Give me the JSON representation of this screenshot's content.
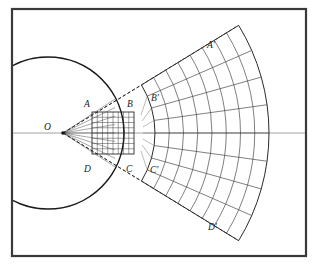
{
  "figure": {
    "background_color": "#ffffff",
    "ink_color": "#1a1a1a",
    "frame": {
      "name": "outer-border",
      "x": 12,
      "y": 9,
      "width": 294,
      "height": 247,
      "stroke": "#3a3a3a",
      "stroke_width": 2.2
    },
    "axis": {
      "name": "horizontal-optical-axis",
      "y": 133,
      "x1": 12,
      "x2": 306,
      "stroke": "#8a8a8a",
      "stroke_width": 0.8
    },
    "origin": {
      "label": "O",
      "x": 63,
      "y": 133,
      "label_x": 44,
      "label_y": 130
    },
    "circle": {
      "name": "reference-circle",
      "cx": 48,
      "cy": 133,
      "r": 76,
      "stroke": "#1a1a1a",
      "stroke_width": 1.6
    },
    "source_square": {
      "name": "source-grid-ABCD",
      "x": 92,
      "y": 112,
      "width": 42,
      "height": 42,
      "rows": 8,
      "columns": 8,
      "stroke": "#2a2a2a",
      "corner_labels": [
        {
          "text": "A",
          "x": 84,
          "y": 107
        },
        {
          "text": "B",
          "x": 127,
          "y": 107
        },
        {
          "text": "C",
          "x": 126,
          "y": 172
        },
        {
          "text": "D",
          "x": 84,
          "y": 172
        }
      ]
    },
    "image_fan": {
      "name": "image-grid-A-prime-B-prime-C-prime-D-prime",
      "center_x": 63,
      "center_y": 133,
      "inner_radius": 92,
      "outer_radius": 206,
      "half_angle_deg": 31.5,
      "arc_count": 9,
      "radial_count": 9,
      "stroke": "#2a2a2a",
      "corner_labels": [
        {
          "text": "A′",
          "x": 207,
          "y": 48
        },
        {
          "text": "B′",
          "x": 151,
          "y": 101
        },
        {
          "text": "C′",
          "x": 150,
          "y": 173
        },
        {
          "text": "D′",
          "x": 208,
          "y": 230
        }
      ]
    },
    "rays": [
      {
        "name": "ray-O-A-Aprime",
        "from": "A",
        "to": "A′",
        "style": "dashed"
      },
      {
        "name": "ray-O-B-Bprime",
        "from": "B",
        "to": "B′",
        "style": "dashed"
      },
      {
        "name": "ray-O-C-Cprime",
        "from": "C",
        "to": "C′",
        "style": "dashed"
      },
      {
        "name": "ray-O-D-Dprime",
        "from": "D",
        "to": "D′",
        "style": "dashed"
      }
    ],
    "labels": {
      "O": "O",
      "A": "A",
      "B": "B",
      "C": "C",
      "D": "D",
      "A_prime": "A′",
      "B_prime": "B′",
      "C_prime": "C′",
      "D_prime": "D′"
    }
  }
}
